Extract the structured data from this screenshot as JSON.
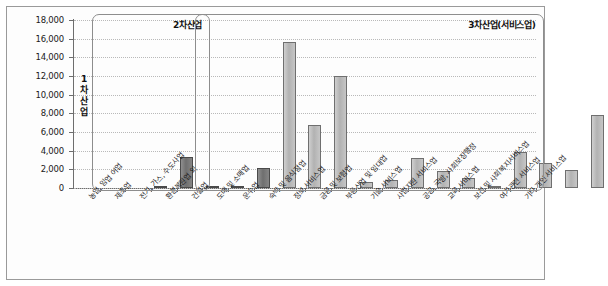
{
  "chart_data": {
    "type": "bar",
    "title": "",
    "xlabel": "",
    "ylabel": "",
    "ylim": [
      0,
      18000
    ],
    "ytick_labels": [
      "0",
      "2,000",
      "4,000",
      "6,000",
      "8,000",
      "10,000",
      "12,000",
      "14,000",
      "16,000",
      "18,000"
    ],
    "ytick_values": [
      0,
      2000,
      4000,
      6000,
      8000,
      10000,
      12000,
      14000,
      16000,
      18000
    ],
    "grid": true,
    "legend": "none",
    "categories": [
      "농업, 임업 어업",
      "제조업",
      "전기, 가스, 수도사업",
      "환경복원업 외",
      "건설업",
      "도매 및 소매업",
      "운수업",
      "숙박 및 음식점업",
      "정보 서비스업",
      "금융 및 보험업",
      "부동산업 및 임대업",
      "기술 서비스업",
      "사업지원 서비스업",
      "공공, 국방, 사회보장행정",
      "교육 서비스업",
      "보건 및 사회복지서비스업",
      "여가관련 서비스업",
      "기타 개인 서비스업"
    ],
    "values": [
      60,
      3300,
      90,
      120,
      2100,
      15650,
      6750,
      12050,
      600,
      900,
      3200,
      1800,
      1050,
      250,
      3850,
      2700,
      1900,
      7800
    ],
    "bar_styles": [
      "dark",
      "dark",
      "dark",
      "dark",
      "dark",
      "light",
      "light",
      "light",
      "light",
      "light",
      "light",
      "light",
      "light",
      "light",
      "light",
      "light",
      "light",
      "light"
    ],
    "groups": [
      {
        "label": "2차산업",
        "from": 1,
        "to": 4
      },
      {
        "label": "3차산업(서비스업)",
        "from": 5,
        "to": 17
      }
    ],
    "primary_label": "1차산업"
  }
}
